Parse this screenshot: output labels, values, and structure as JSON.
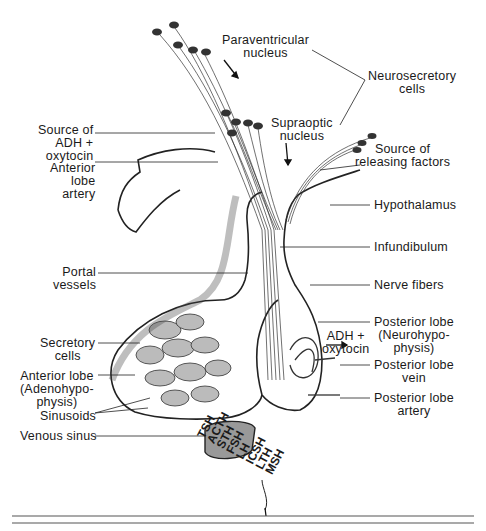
{
  "diagram": {
    "labels": {
      "paraventricular": "Paraventricular\nnucleus",
      "neurosecretory": "Neurosecretory\ncells",
      "supraoptic": "Supraoptic\nnucleus",
      "source_adh": "Source of\nADH +\noxytocin",
      "anterior_lobe_artery": "Anterior\nlobe\nartery",
      "source_releasing": "Source of\nreleasing factors",
      "hypothalamus": "Hypothalamus",
      "infundibulum": "Infundibulum",
      "portal_vessels": "Portal\nvessels",
      "nerve_fibers": "Nerve fibers",
      "posterior_lobe": "Posterior lobe\n(Neurohypo-\nphysis)",
      "adh_oxytocin": "ADH +\noxytocin",
      "secretory_cells": "Secretory\ncells",
      "anterior_lobe": "Anterior lobe\n(Adenohypo-\nphysis)",
      "posterior_lobe_vein": "Posterior lobe\nvein",
      "sinusoids": "Sinusoids",
      "posterior_lobe_artery": "Posterior lobe\nartery",
      "venous_sinus": "Venous sinus"
    },
    "hormones": [
      "TSH",
      "ACTH",
      "STH",
      "FSH",
      "LH",
      "ICSH",
      "LTH",
      "MSH"
    ]
  }
}
